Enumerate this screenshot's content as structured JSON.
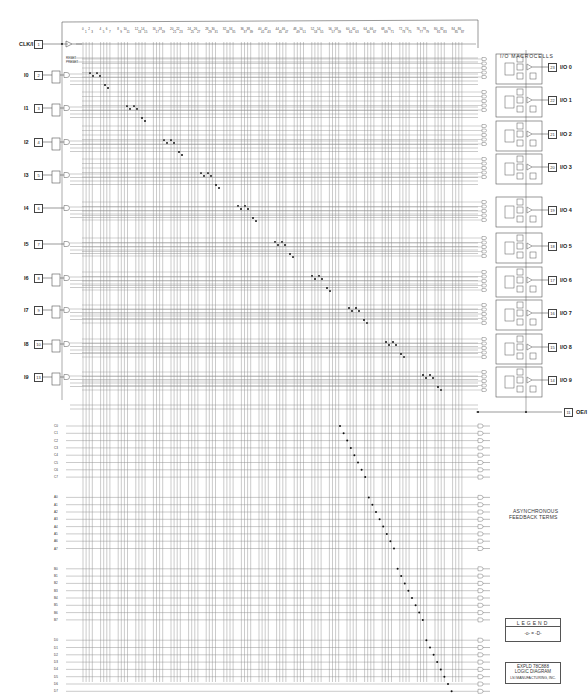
{
  "title_block": {
    "device": "EXPLD 78C888",
    "subtitle": "LOGIC DIAGRAM",
    "footer": "LSI MANUFACTURING, INC."
  },
  "legend": {
    "title": "LEGEND",
    "symbol_text": "-o- = -D-"
  },
  "macrocell_section_label": "I/O MACROCELLS",
  "async_feedback_label": [
    "ASYNCHRONOUS",
    "FEEDBACK TERMS"
  ],
  "clock_input": {
    "label": "CLK/I",
    "pin": "1",
    "y": 44
  },
  "oe_input": {
    "label": "OE/I",
    "pin": "11",
    "y": 412
  },
  "inputs": [
    {
      "label": "I0",
      "pin": "2",
      "y": 75,
      "latched": true
    },
    {
      "label": "I1",
      "pin": "3",
      "y": 108,
      "latched": true
    },
    {
      "label": "I2",
      "pin": "4",
      "y": 142,
      "latched": true
    },
    {
      "label": "I3",
      "pin": "5",
      "y": 175,
      "latched": true
    },
    {
      "label": "I4",
      "pin": "6",
      "y": 208,
      "latched": false
    },
    {
      "label": "I5",
      "pin": "7",
      "y": 244,
      "latched": false
    },
    {
      "label": "I6",
      "pin": "8",
      "y": 278,
      "latched": true
    },
    {
      "label": "I7",
      "pin": "9",
      "y": 310,
      "latched": true
    },
    {
      "label": "I8",
      "pin": "10",
      "y": 344,
      "latched": true
    },
    {
      "label": "I9",
      "pin": "13",
      "y": 377,
      "latched": true
    }
  ],
  "outputs": [
    {
      "label": "I/O 0",
      "pin": "23",
      "y": 67
    },
    {
      "label": "I/O 1",
      "pin": "22",
      "y": 100
    },
    {
      "label": "I/O 2",
      "pin": "21",
      "y": 134
    },
    {
      "label": "I/O 3",
      "pin": "20",
      "y": 167
    },
    {
      "label": "I/O 4",
      "pin": "19",
      "y": 210
    },
    {
      "label": "I/O 5",
      "pin": "18",
      "y": 246
    },
    {
      "label": "I/O 6",
      "pin": "17",
      "y": 280
    },
    {
      "label": "I/O 7",
      "pin": "16",
      "y": 313
    },
    {
      "label": "I/O 8",
      "pin": "15",
      "y": 347
    },
    {
      "label": "I/O 9",
      "pin": "14",
      "y": 380
    }
  ],
  "term_labels_top": [
    "RESET",
    "PRESET"
  ],
  "term_groups_lower": [
    [
      "C0",
      "C1",
      "C2",
      "C3",
      "C4",
      "C5",
      "C6",
      "C7"
    ],
    [
      "A0",
      "A1",
      "A2",
      "A3",
      "A4",
      "A5",
      "A6",
      "A7"
    ],
    [
      "B0",
      "B1",
      "B2",
      "B3",
      "B4",
      "B5",
      "B6",
      "B7"
    ],
    [
      "D0",
      "D1",
      "D2",
      "D3",
      "D4",
      "D5",
      "D6",
      "D7"
    ]
  ],
  "column_numbers": [
    "0",
    "1",
    "2",
    "3",
    "4",
    "5",
    "6",
    "7",
    "8",
    "9",
    "10",
    "11",
    "12",
    "13",
    "14",
    "15",
    "16",
    "17",
    "18",
    "19",
    "20",
    "21",
    "22",
    "23",
    "24",
    "25",
    "26",
    "27",
    "28",
    "29",
    "30",
    "31",
    "32",
    "33",
    "34",
    "35",
    "36",
    "37",
    "38",
    "39",
    "40",
    "41",
    "42",
    "43",
    "44",
    "45",
    "46",
    "47",
    "48",
    "49",
    "50",
    "51",
    "52",
    "53",
    "54",
    "55",
    "56",
    "57",
    "58",
    "59",
    "60",
    "61",
    "62",
    "63",
    "64",
    "65",
    "66",
    "67",
    "68",
    "69",
    "70",
    "71",
    "72",
    "73",
    "74",
    "75",
    "76",
    "77",
    "78",
    "79",
    "80",
    "81",
    "82",
    "83",
    "84",
    "85",
    "86",
    "87",
    "88",
    "89",
    "90",
    "91",
    "92",
    "93",
    "94",
    "95",
    "96"
  ],
  "colors": {
    "line": "#555555",
    "grid": "#8a8a8a",
    "dot": "#111111",
    "bg": "#ffffff"
  }
}
